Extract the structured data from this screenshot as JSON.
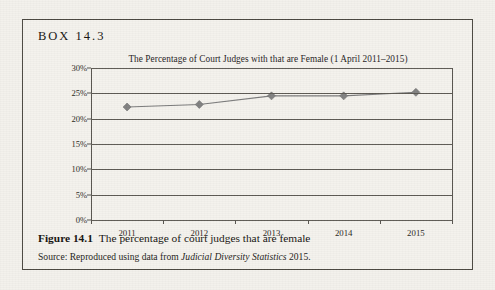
{
  "box": {
    "label": "BOX 14.3"
  },
  "figure": {
    "number": "Figure 14.1",
    "caption": "The percentage of court judges that are female",
    "source_prefix": "Source: Reproduced using data from",
    "source_italic": "Judicial Diversity Statistics",
    "source_suffix": "2015."
  },
  "colors": {
    "marker": "#808080",
    "line": "#7a7a7a",
    "grid": "#5c5953",
    "axis": "#55524c",
    "box_border": "#4a4740",
    "page_bg": "#f3f1ec"
  },
  "chart_data": {
    "type": "line",
    "title": "The Percentage of Court Judges with that are Female (1 April 2011–2015)",
    "xlabel": "",
    "ylabel": "",
    "categories": [
      "2011",
      "2012",
      "2013",
      "2014",
      "2015"
    ],
    "values": [
      22.3,
      22.8,
      24.5,
      24.5,
      25.2
    ],
    "series": [
      {
        "name": "Percentage female",
        "values": [
          22.3,
          22.8,
          24.5,
          24.5,
          25.2
        ]
      }
    ],
    "ylim": [
      0,
      30
    ],
    "ytick_labels": [
      "0%",
      "5%",
      "10%",
      "15%",
      "20%",
      "25%",
      "30%"
    ],
    "ytick_values": [
      0,
      5,
      10,
      15,
      20,
      25,
      30
    ],
    "grid": true,
    "legend": false,
    "marker": "diamond"
  }
}
